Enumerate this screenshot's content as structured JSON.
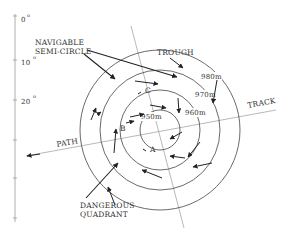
{
  "scale": {
    "ticks": [
      {
        "label": "0",
        "unit": "o",
        "y": 16
      },
      {
        "label": "10",
        "unit": "o",
        "y": 60
      },
      {
        "label": "20",
        "unit": "o",
        "y": 100
      },
      {
        "label": "",
        "unit": "",
        "y": 140
      },
      {
        "label": "",
        "unit": "",
        "y": 178
      },
      {
        "label": "",
        "unit": "",
        "y": 218
      }
    ]
  },
  "labels": {
    "navigable_line1": "NAVIGABLE",
    "navigable_line2": "SEMI-CIRCLE",
    "trough": "TROUGH",
    "track": "TRACK",
    "path": "PATH",
    "dangerous_line1": "DANGEROUS",
    "dangerous_line2": "QUADRANT",
    "point_a": "A",
    "point_b": "B",
    "point_c": "C"
  },
  "isobars": [
    {
      "label": "950m",
      "r": 20
    },
    {
      "label": "960m",
      "r": 40
    },
    {
      "label": "970m",
      "r": 60
    },
    {
      "label": "980m",
      "r": 80
    }
  ],
  "colors": {
    "line": "#333333",
    "axis": "#888888"
  }
}
